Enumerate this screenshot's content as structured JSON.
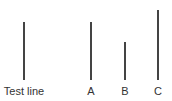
{
  "diagram": {
    "type": "line-length-comparison",
    "line_color": "#444444",
    "label_color": "#333333",
    "lines": [
      {
        "id": "test",
        "label": "Test line",
        "x": 24,
        "top": 22,
        "bottom": 80,
        "length": 58
      },
      {
        "id": "a",
        "label": "A",
        "x": 91,
        "top": 22,
        "bottom": 80,
        "length": 58
      },
      {
        "id": "b",
        "label": "B",
        "x": 125,
        "top": 42,
        "bottom": 80,
        "length": 38
      },
      {
        "id": "c",
        "label": "C",
        "x": 158,
        "top": 10,
        "bottom": 80,
        "length": 70
      }
    ]
  }
}
